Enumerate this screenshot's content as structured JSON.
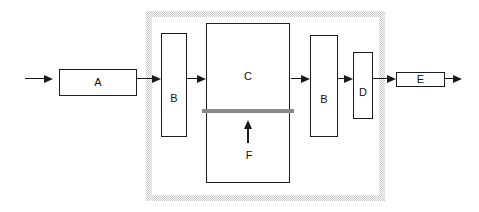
{
  "diagram": {
    "type": "block-diagram",
    "blocks": [
      {
        "id": "block-a",
        "label": "A"
      },
      {
        "id": "block-b1",
        "label": "B"
      },
      {
        "id": "block-c",
        "label": "C"
      },
      {
        "id": "block-b2",
        "label": "B"
      },
      {
        "id": "block-d",
        "label": "D"
      },
      {
        "id": "block-e",
        "label": "E"
      }
    ],
    "annotations": [
      {
        "id": "input-f",
        "label": "F"
      }
    ],
    "colors": {
      "line": "#1a1a1a",
      "block_border": "#1c1c1c",
      "divider_bar": "#8a8a8a",
      "boundary_stipple": "#c9c9c9",
      "background": "#ffffff"
    }
  }
}
